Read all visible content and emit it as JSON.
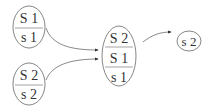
{
  "nodes": [
    {
      "id": "n1",
      "rows": [
        "S 1",
        "s 1"
      ]
    },
    {
      "id": "n2",
      "rows": [
        "S 2",
        "s 2"
      ]
    },
    {
      "id": "n3",
      "rows": [
        "S 2",
        "S 1",
        "s 1"
      ]
    },
    {
      "id": "n4",
      "rows": [
        "s 2"
      ]
    }
  ],
  "edges": [
    {
      "from": "n1",
      "to": "n3"
    },
    {
      "from": "n2",
      "to": "n3"
    },
    {
      "from": "n3",
      "to": "n4"
    }
  ],
  "colors": {
    "stroke": "#555555",
    "text": "#333333"
  }
}
